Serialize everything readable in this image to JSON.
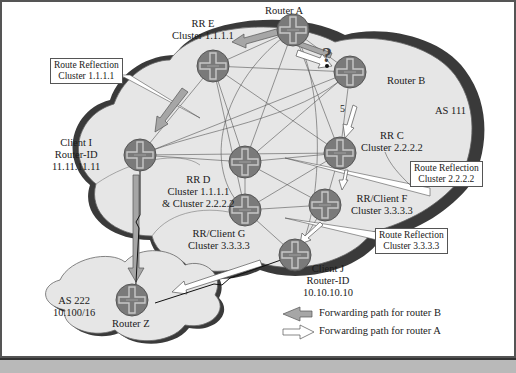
{
  "diagram": {
    "as_labels": {
      "as111": "AS 111",
      "as222_line1": "AS 222",
      "as222_line2": "10.100/16"
    },
    "routers": {
      "a": {
        "line1": "Router A"
      },
      "b": {
        "line1": "Router B"
      },
      "c": {
        "line1": "RR C",
        "line2": "Cluster 2.2.2.2"
      },
      "d": {
        "line1": "RR D",
        "line2": "Cluster 1.1.1.1",
        "line3": "& Cluster 2.2.2.2"
      },
      "e": {
        "line1": "RR E",
        "line2": "Cluster 1.1.1.1"
      },
      "f": {
        "line1": "RR/Client F",
        "line2": "Cluster 3.3.3.3"
      },
      "g": {
        "line1": "RR/Client G",
        "line2": "Cluster 3.3.3.3"
      },
      "i": {
        "line1": "Client I",
        "line2": "Router-ID",
        "line3": "11.11.11.11"
      },
      "j": {
        "line1": "Client J",
        "line2": "Router-ID",
        "line3": "10.10.10.10"
      },
      "z": {
        "line1": "Router Z"
      }
    },
    "callouts": {
      "rr1": {
        "line1": "Route Reflection",
        "line2": "Cluster 1.1.1.1"
      },
      "rr2": {
        "line1": "Route Reflection",
        "line2": "Cluster 2.2.2.2"
      },
      "rr3": {
        "line1": "Route Reflection",
        "line2": "Cluster 3.3.3.3"
      }
    },
    "link_metric": "5",
    "question_mark": "?",
    "legend": {
      "router_b": "Forwarding path for router B",
      "router_a": "Forwarding path for router A"
    },
    "colors": {
      "cloud_fill": "#e6e6e6",
      "cloud_shadow": "#3a3a3a",
      "router_fill": "#7a7a7a",
      "router_cross": "#bdbdbd",
      "path_b_arrow": "#a6a6a6",
      "path_a_arrow": "#ffffff",
      "caption_bar": "#b9b9b9"
    }
  }
}
